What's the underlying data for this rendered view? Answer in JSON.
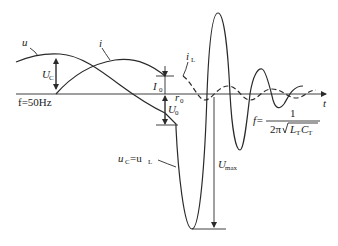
{
  "diagram": {
    "axis": {
      "time_label": "t"
    },
    "curves": {
      "u": {
        "label": "u"
      },
      "i": {
        "label": "i"
      },
      "iL": {
        "label": "i",
        "sub": "L"
      },
      "uC": {
        "label": "u",
        "sub": "C",
        "eq": "=u",
        "sub2": "L"
      }
    },
    "annotations": {
      "Uc": {
        "label": "U",
        "sub": "C"
      },
      "I0": {
        "label": "I",
        "sub": "0"
      },
      "r0": {
        "label": "r",
        "sub": "0"
      },
      "U0": {
        "label": "U",
        "sub": "0"
      },
      "Umax": {
        "label": "U",
        "sub": "max"
      },
      "freq_power": "f=50Hz",
      "freq_osc": {
        "lhs": "f=",
        "numerator": "1",
        "denominator_prefix": "2π",
        "radicand_L": "L",
        "radicand_L_sub": "T",
        "radicand_C": "C",
        "radicand_C_sub": "T"
      }
    },
    "colors": {
      "stroke": "#2a2a2a",
      "background": "#ffffff"
    }
  }
}
